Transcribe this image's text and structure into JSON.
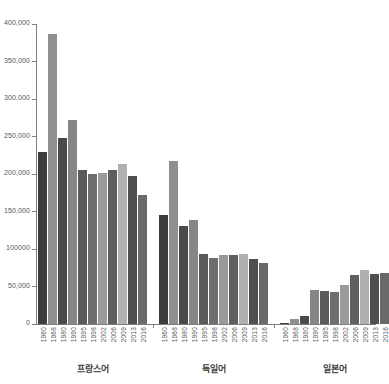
{
  "chart_data": {
    "type": "bar",
    "title": "",
    "subtitle": "",
    "xlabel": "",
    "ylabel": "",
    "ylim": [
      0,
      400000
    ],
    "grid": false,
    "legend_position": "none",
    "y_ticks": [
      {
        "value": 0,
        "label": "0"
      },
      {
        "value": 50000,
        "label": "50,000"
      },
      {
        "value": 100000,
        "label": "100000"
      },
      {
        "value": 150000,
        "label": "150,000"
      },
      {
        "value": 200000,
        "label": "200,000"
      },
      {
        "value": 250000,
        "label": "250,000"
      },
      {
        "value": 300000,
        "label": "300,000"
      },
      {
        "value": 350000,
        "label": "350,000"
      },
      {
        "value": 400000,
        "label": "400,000"
      }
    ],
    "categories": [
      "1960",
      "1968",
      "1980",
      "1990",
      "1995",
      "1998",
      "2002",
      "2006",
      "2009",
      "2013",
      "2016"
    ],
    "groups": [
      {
        "name": "프랑스어",
        "bars": [
          {
            "x": "1960",
            "value": 230000,
            "color": "#3c3c3c"
          },
          {
            "x": "1968",
            "value": 387000,
            "color": "#8f8f8f"
          },
          {
            "x": "1980",
            "value": 248000,
            "color": "#4a4a4a"
          },
          {
            "x": "1990",
            "value": 272000,
            "color": "#868686"
          },
          {
            "x": "1995",
            "value": 205000,
            "color": "#5a5a5a"
          },
          {
            "x": "1998",
            "value": 200000,
            "color": "#6e6e6e"
          },
          {
            "x": "2002",
            "value": 202000,
            "color": "#9a9a9a"
          },
          {
            "x": "2006",
            "value": 205000,
            "color": "#5f5f5f"
          },
          {
            "x": "2009",
            "value": 214000,
            "color": "#b0b0b0"
          },
          {
            "x": "2013",
            "value": 198000,
            "color": "#4f4f4f"
          },
          {
            "x": "2016",
            "value": 172000,
            "color": "#6a6a6a"
          }
        ]
      },
      {
        "name": "독일어",
        "bars": [
          {
            "x": "1960",
            "value": 146000,
            "color": "#3c3c3c"
          },
          {
            "x": "1968",
            "value": 217000,
            "color": "#8f8f8f"
          },
          {
            "x": "1980",
            "value": 131000,
            "color": "#4a4a4a"
          },
          {
            "x": "1990",
            "value": 139000,
            "color": "#868686"
          },
          {
            "x": "1995",
            "value": 93000,
            "color": "#5a5a5a"
          },
          {
            "x": "1998",
            "value": 88000,
            "color": "#6e6e6e"
          },
          {
            "x": "2002",
            "value": 92000,
            "color": "#9a9a9a"
          },
          {
            "x": "2006",
            "value": 92000,
            "color": "#5f5f5f"
          },
          {
            "x": "2009",
            "value": 94000,
            "color": "#b0b0b0"
          },
          {
            "x": "2013",
            "value": 87000,
            "color": "#4f4f4f"
          },
          {
            "x": "2016",
            "value": 81000,
            "color": "#6a6a6a"
          }
        ]
      },
      {
        "name": "일본어",
        "bars": [
          {
            "x": "1960",
            "value": 1500,
            "color": "#3c3c3c"
          },
          {
            "x": "1968",
            "value": 7000,
            "color": "#8f8f8f"
          },
          {
            "x": "1980",
            "value": 11000,
            "color": "#4a4a4a"
          },
          {
            "x": "1990",
            "value": 45000,
            "color": "#868686"
          },
          {
            "x": "1995",
            "value": 44000,
            "color": "#5a5a5a"
          },
          {
            "x": "1998",
            "value": 43000,
            "color": "#6e6e6e"
          },
          {
            "x": "2002",
            "value": 52000,
            "color": "#9a9a9a"
          },
          {
            "x": "2006",
            "value": 66000,
            "color": "#5f5f5f"
          },
          {
            "x": "2009",
            "value": 72000,
            "color": "#b0b0b0"
          },
          {
            "x": "2013",
            "value": 67000,
            "color": "#4f4f4f"
          },
          {
            "x": "2016",
            "value": 68000,
            "color": "#6a6a6a"
          }
        ]
      }
    ]
  }
}
